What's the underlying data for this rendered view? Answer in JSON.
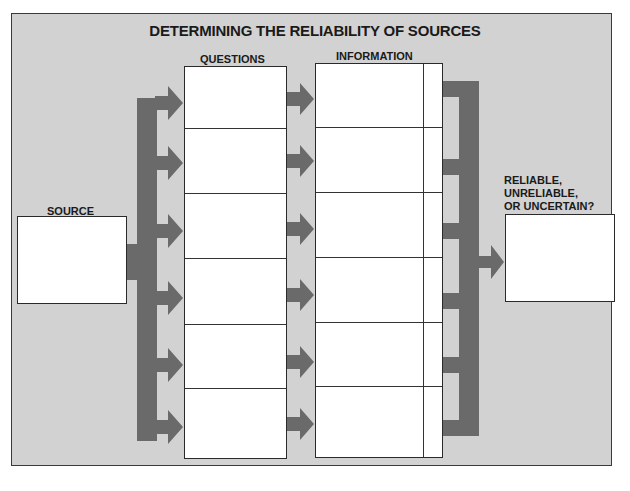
{
  "diagram": {
    "title": "DETERMINING THE RELIABILITY OF SOURCES",
    "labels": {
      "source": "SOURCE",
      "questions": "QUESTIONS",
      "information": "INFORMATION",
      "verdict_line1": "RELIABLE,",
      "verdict_line2": "UNRELIABLE,",
      "verdict_line3": "OR UNCERTAIN?"
    },
    "rows": 6,
    "colors": {
      "background": "#d2d2d2",
      "arrow": "#6a6a6a",
      "box": "#ffffff",
      "border": "#2a2a2a"
    }
  }
}
